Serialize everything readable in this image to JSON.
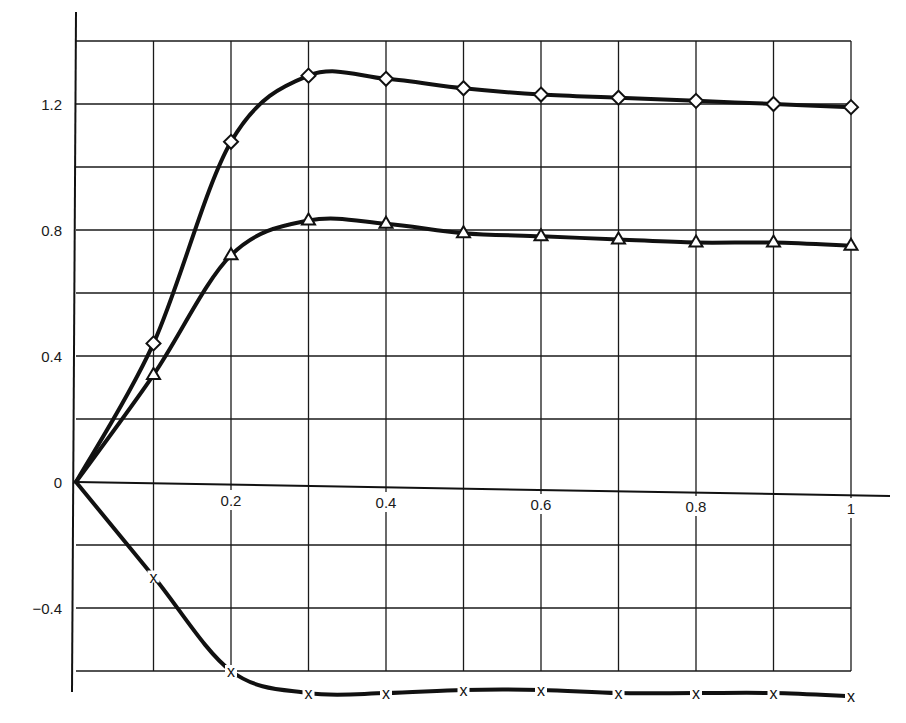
{
  "chart_data": {
    "type": "line",
    "title": "",
    "xlabel": "",
    "ylabel": "",
    "xlim": [
      0,
      1.0
    ],
    "ylim": [
      -0.7,
      1.4
    ],
    "grid": true,
    "legend": null,
    "x_ticks": [
      {
        "value": 0.2,
        "label": "0.2"
      },
      {
        "value": 0.4,
        "label": "0.4"
      },
      {
        "value": 0.6,
        "label": "0.6"
      },
      {
        "value": 0.8,
        "label": "0.8"
      },
      {
        "value": 1.0,
        "label": "1"
      }
    ],
    "y_ticks": [
      {
        "value": 1.2,
        "label": "1.2"
      },
      {
        "value": 0.8,
        "label": "0.8"
      },
      {
        "value": 0.4,
        "label": "0.4"
      },
      {
        "value": 0,
        "label": "0"
      },
      {
        "value": -0.4,
        "label": "-0.4"
      }
    ],
    "x": [
      0,
      0.1,
      0.2,
      0.3,
      0.4,
      0.5,
      0.6,
      0.7,
      0.8,
      0.9,
      1.0
    ],
    "series": [
      {
        "name": "diamond",
        "marker": "diamond",
        "values": [
          0,
          0.44,
          1.08,
          1.29,
          1.28,
          1.25,
          1.23,
          1.22,
          1.21,
          1.2,
          1.19
        ]
      },
      {
        "name": "triangle",
        "marker": "triangle",
        "values": [
          0,
          0.34,
          0.72,
          0.83,
          0.82,
          0.79,
          0.78,
          0.77,
          0.76,
          0.76,
          0.75
        ]
      },
      {
        "name": "cross",
        "marker": "x",
        "values": [
          0,
          -0.3,
          -0.6,
          -0.67,
          -0.67,
          -0.66,
          -0.66,
          -0.67,
          -0.67,
          -0.67,
          -0.68
        ]
      }
    ]
  }
}
